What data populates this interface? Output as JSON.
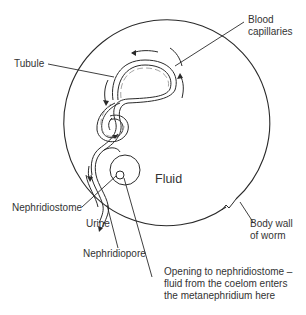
{
  "diagram": {
    "labels": {
      "tubule": "Tubule",
      "blood_capillaries_1": "Blood",
      "blood_capillaries_2": "capillaries",
      "fluid": "Fluid",
      "nephridiostome": "Nephridiostome",
      "urine": "Urine",
      "nephridiopore": "Nephridiopore",
      "body_wall_1": "Body wall",
      "body_wall_2": "of worm",
      "opening_1": "Opening to nephridiostome –",
      "opening_2": "fluid from the coelom enters",
      "opening_3": "the metanephridium here"
    },
    "colors": {
      "line": "#2a2a2a",
      "capillary": "#9a9a9a",
      "background": "#ffffff"
    }
  }
}
